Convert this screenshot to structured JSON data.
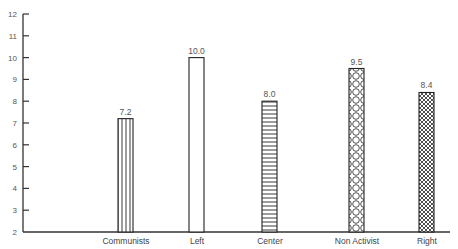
{
  "chart_data": {
    "type": "bar",
    "title": "",
    "xlabel": "",
    "ylabel": "",
    "ylim": [
      2,
      12
    ],
    "yticks": [
      2,
      3,
      4,
      5,
      6,
      7,
      8,
      9,
      10,
      11,
      12
    ],
    "grid": false,
    "legend": null,
    "categories": [
      "Communists",
      "Left",
      "Center",
      "Non Activist",
      "Right"
    ],
    "values": [
      7.2,
      10.0,
      8.0,
      9.5,
      8.4
    ],
    "value_labels": [
      "7.2",
      "10.0",
      "8.0",
      "9.5",
      "8.4"
    ],
    "patterns": [
      "vertical-lines",
      "blank",
      "horizontal-lines",
      "circles",
      "crosshatch"
    ]
  },
  "colors": {
    "axis": "#333333",
    "bar_stroke": "#222222",
    "text": "#555555"
  }
}
